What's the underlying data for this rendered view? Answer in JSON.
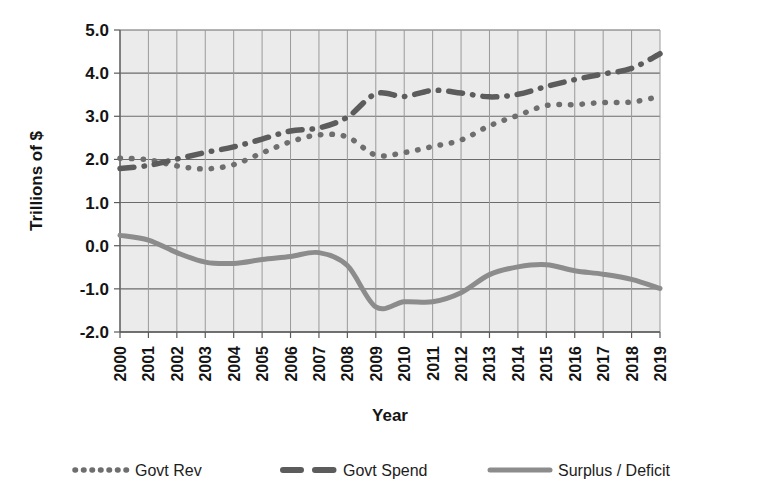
{
  "chart_data": {
    "type": "line",
    "title": "",
    "xlabel": "Year",
    "ylabel": "Trillions of $",
    "x": [
      2000,
      2001,
      2002,
      2003,
      2004,
      2005,
      2006,
      2007,
      2008,
      2009,
      2010,
      2011,
      2012,
      2013,
      2014,
      2015,
      2016,
      2017,
      2018,
      2019
    ],
    "xtick_labels": [
      "2000",
      "2001",
      "2002",
      "2003",
      "2004",
      "2005",
      "2006",
      "2007",
      "2008",
      "2009",
      "2010",
      "2011",
      "2012",
      "2013",
      "2014",
      "2015",
      "2016",
      "2017",
      "2018",
      "2019"
    ],
    "ytick_labels": [
      "5.0",
      "4.0",
      "3.0",
      "2.0",
      "1.0",
      "0.0",
      "-1.0",
      "-2.0"
    ],
    "ytick_values": [
      5.0,
      4.0,
      3.0,
      2.0,
      1.0,
      0.0,
      -1.0,
      -2.0
    ],
    "ylim": [
      -2.0,
      5.0
    ],
    "xlim": [
      2000,
      2019
    ],
    "grid": "both",
    "legend_position": "bottom",
    "series": [
      {
        "name": "Govt Rev",
        "style": "dotted",
        "color": "#6e6e6e",
        "values": [
          2.03,
          1.99,
          1.85,
          1.78,
          1.88,
          2.15,
          2.41,
          2.57,
          2.52,
          2.1,
          2.16,
          2.3,
          2.45,
          2.78,
          3.02,
          3.25,
          3.27,
          3.32,
          3.33,
          3.46
        ]
      },
      {
        "name": "Govt Spend",
        "style": "dashed",
        "color": "#5c5c5c",
        "values": [
          1.79,
          1.86,
          2.01,
          2.16,
          2.29,
          2.47,
          2.66,
          2.73,
          2.98,
          3.52,
          3.46,
          3.6,
          3.54,
          3.45,
          3.51,
          3.69,
          3.85,
          3.98,
          4.11,
          4.45
        ]
      },
      {
        "name": "Surplus / Deficit",
        "style": "solid",
        "color": "#8c8c8c",
        "values": [
          0.24,
          0.13,
          -0.16,
          -0.38,
          -0.41,
          -0.32,
          -0.25,
          -0.16,
          -0.46,
          -1.42,
          -1.3,
          -1.3,
          -1.09,
          -0.67,
          -0.49,
          -0.44,
          -0.58,
          -0.66,
          -0.78,
          -0.99
        ]
      }
    ]
  },
  "legend": {
    "items": [
      {
        "label": "Govt Rev",
        "marker": "dotted-marker"
      },
      {
        "label": "Govt Spend",
        "marker": "dashed-marker"
      },
      {
        "label": "Surplus / Deficit",
        "marker": "solid-marker"
      }
    ]
  },
  "axes": {
    "y_title": "Trillions of $",
    "x_title": "Year"
  }
}
